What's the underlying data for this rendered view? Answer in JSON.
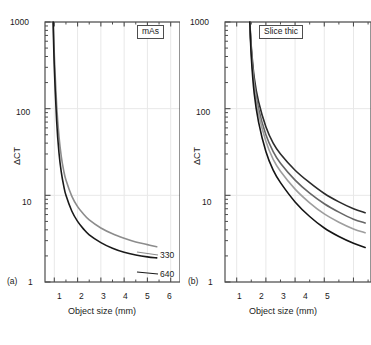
{
  "figure": {
    "background": "#ffffff",
    "axis_color": "#4d4d4d",
    "grid_color": "#e8e8e8",
    "text_color": "#1a1a1a"
  },
  "panels": [
    {
      "tag": "(a)",
      "legend_title": "mAs",
      "xlabel": "Object size (mm)",
      "ylabel": "ΔCT",
      "xticks": [
        "1",
        "2",
        "3",
        "4",
        "5",
        "6"
      ],
      "yticks": [
        "1",
        "10",
        "100",
        "1000"
      ]
    },
    {
      "tag": "(b)",
      "legend_title": "Slice thic",
      "xlabel": "Object size (mm)",
      "ylabel": "ΔCT",
      "xticks": [
        "1",
        "2",
        "3",
        "4",
        "5"
      ],
      "yticks": [
        "1",
        "10",
        "100",
        "1000"
      ]
    }
  ],
  "chart_data": [
    {
      "type": "line",
      "title": "",
      "subtitle": "",
      "panel": "(a)",
      "xlabel": "Object size (mm)",
      "ylabel": "ΔCT",
      "xlim": [
        0.6,
        6.4
      ],
      "ylim": [
        1,
        1000
      ],
      "yscale": "log",
      "xscale": "linear",
      "grid": true,
      "legend": "mAs",
      "legend_position": "top-right",
      "annotations": [
        "(a)"
      ],
      "series": [
        {
          "name": "330",
          "color": "#8c8c8c",
          "label_at_end": true,
          "x": [
            0.95,
            1.0,
            1.1,
            1.2,
            1.3,
            1.4,
            1.5,
            1.75,
            2.0,
            2.25,
            2.5,
            3.0,
            3.5,
            4.0,
            4.5,
            5.0,
            5.4
          ],
          "y": [
            1000,
            420,
            110,
            48,
            28,
            19.5,
            15.0,
            9.8,
            7.4,
            6.1,
            5.2,
            4.2,
            3.6,
            3.2,
            2.9,
            2.7,
            2.55
          ]
        },
        {
          "name": "640",
          "color": "#1a1a1a",
          "label_at_end": true,
          "x": [
            0.95,
            1.0,
            1.1,
            1.2,
            1.3,
            1.4,
            1.5,
            1.75,
            2.0,
            2.25,
            2.5,
            3.0,
            3.5,
            4.0,
            4.5,
            5.0,
            5.4
          ],
          "y": [
            1000,
            300,
            72,
            31,
            18.5,
            13.0,
            10.0,
            6.6,
            5.0,
            4.1,
            3.5,
            2.85,
            2.45,
            2.2,
            2.05,
            1.95,
            1.9
          ]
        }
      ]
    },
    {
      "type": "line",
      "title": "",
      "subtitle": "",
      "panel": "(b)",
      "xlabel": "Object size (mm)",
      "ylabel": "ΔCT",
      "xlim": [
        0.6,
        5.6
      ],
      "ylim": [
        1,
        1000
      ],
      "yscale": "log",
      "xscale": "linear",
      "grid": true,
      "legend": "Slice thic",
      "legend_position": "top-right",
      "annotations": [
        "(b)"
      ],
      "note": "Right portion of panel is cropped by the image edge",
      "series": [
        {
          "name": "curve-1",
          "color": "#2b2b2b",
          "x": [
            1.45,
            1.5,
            1.6,
            1.75,
            2.0,
            2.25,
            2.5,
            3.0,
            3.5,
            4.0,
            4.5,
            5.0,
            5.4
          ],
          "y": [
            1000,
            520,
            230,
            120,
            62,
            40,
            30,
            19.5,
            14.0,
            10.5,
            8.4,
            7.0,
            6.3
          ]
        },
        {
          "name": "curve-2",
          "color": "#666666",
          "x": [
            1.45,
            1.5,
            1.6,
            1.75,
            2.0,
            2.25,
            2.5,
            3.0,
            3.5,
            4.0,
            4.5,
            5.0,
            5.4
          ],
          "y": [
            1000,
            480,
            200,
            100,
            50,
            32,
            23.5,
            15.0,
            10.6,
            8.0,
            6.4,
            5.3,
            4.8
          ]
        },
        {
          "name": "curve-3",
          "color": "#9e9e9e",
          "x": [
            1.45,
            1.5,
            1.6,
            1.75,
            2.0,
            2.25,
            2.5,
            3.0,
            3.5,
            4.0,
            4.5,
            5.0,
            5.4
          ],
          "y": [
            1000,
            450,
            180,
            88,
            42,
            26,
            19.0,
            11.8,
            8.2,
            6.1,
            4.9,
            4.1,
            3.7
          ]
        },
        {
          "name": "curve-4",
          "color": "#151515",
          "x": [
            1.45,
            1.5,
            1.6,
            1.75,
            2.0,
            2.25,
            2.5,
            3.0,
            3.5,
            4.0,
            4.5,
            5.0,
            5.4
          ],
          "y": [
            1000,
            400,
            150,
            70,
            32,
            19.5,
            14.0,
            8.4,
            5.7,
            4.2,
            3.35,
            2.8,
            2.5
          ]
        }
      ]
    }
  ]
}
